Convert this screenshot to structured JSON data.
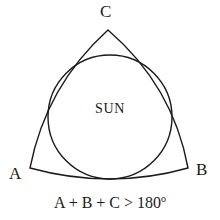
{
  "figure": {
    "name": "spherical-triangle-with-inscribed-sun",
    "background_color": "#ffffff",
    "stroke_color": "#1a1a1a",
    "labels": {
      "vertex_c": "C",
      "vertex_a": "A",
      "vertex_b": "B",
      "circle_label": "SUN"
    },
    "caption": {
      "expression": "A + B + C > 180",
      "degree_symbol": "o"
    },
    "geometry": {
      "vertex_c_point": [
        108,
        30
      ],
      "vertex_a_point": [
        30,
        168
      ],
      "vertex_b_point": [
        188,
        168
      ],
      "circle_center": [
        110,
        117
      ],
      "circle_radius": 62,
      "edges": "outward-bowed arcs tangent to circle"
    }
  }
}
